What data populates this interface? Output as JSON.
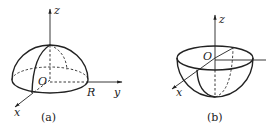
{
  "figure_a": {
    "caption": "(a)",
    "axis_labels": {
      "x": "x",
      "y": "y",
      "z": "z"
    },
    "origin_label": "O",
    "radius_label": "R",
    "shape": "upper hemisphere"
  },
  "figure_b": {
    "caption": "(b)",
    "axis_labels": {
      "x": "x",
      "z": "z"
    },
    "origin_label": "O",
    "shape": "lower hemisphere (bowl)"
  },
  "colors": {
    "stroke": "#222222",
    "background": "#ffffff"
  }
}
